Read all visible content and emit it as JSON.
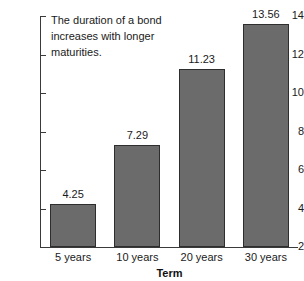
{
  "chart_data": {
    "type": "bar",
    "title": "",
    "subtitle": "",
    "xlabel": "Term",
    "ylabel": "",
    "categories": [
      "5 years",
      "10 years",
      "20 years",
      "30 years"
    ],
    "values": [
      4.25,
      7.29,
      11.23,
      13.56
    ],
    "value_labels": [
      "4.25",
      "7.29",
      "11.23",
      "13.56"
    ],
    "ylim": [
      2,
      14
    ],
    "ytick_values": [
      2,
      4,
      6,
      8,
      10,
      12,
      14
    ],
    "ytick_labels": [
      "2",
      "4",
      "6",
      "8",
      "10",
      "12",
      "14"
    ],
    "grid": false,
    "legend": false,
    "annotations": [
      "The duration of a bond increases with longer maturities."
    ],
    "colors": {
      "bar_fill": "#6b6b6b",
      "bar_edge": "#2e2e2e",
      "axis": "#3a3a3a",
      "text": "#1a1a1a",
      "background": "#ffffff"
    }
  }
}
